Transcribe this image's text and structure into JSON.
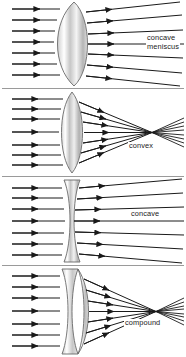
{
  "diagram": {
    "background_color": "#ffffff",
    "ray_color": "#1a1a1a",
    "lens_outline_color": "#5a5a5a",
    "lens_fill_light": "#ffffff",
    "lens_fill_mid": "#d2d2d2",
    "lens_fill_dark": "#9c9c9c",
    "divider_color": "#9a9a9a",
    "ray_count": 7,
    "panels": [
      {
        "id": "concave-meniscus",
        "label": "concave meniscus",
        "label_line_1": "concave",
        "label_line_2": "meniscus",
        "lens_type": "meniscus",
        "behavior": "diverging",
        "focal_point": false
      },
      {
        "id": "convex",
        "label": "convex",
        "lens_type": "biconvex",
        "behavior": "converging",
        "focal_point": true
      },
      {
        "id": "concave",
        "label": "concave",
        "lens_type": "biconcave",
        "behavior": "diverging",
        "focal_point": false
      },
      {
        "id": "compound",
        "label": "compound",
        "lens_type": "compound",
        "behavior": "converging",
        "focal_point": true
      }
    ]
  }
}
